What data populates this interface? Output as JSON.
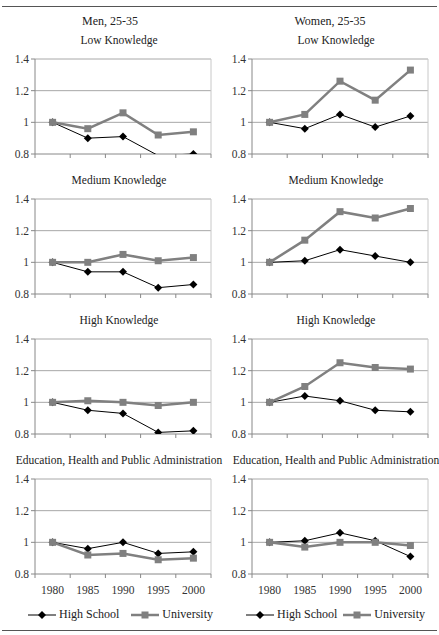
{
  "header": {
    "top_text": ""
  },
  "columns": [
    {
      "title": "Men, 25-35"
    },
    {
      "title": "Women, 25-35"
    }
  ],
  "legend": {
    "high_school": "High School",
    "university": "University"
  },
  "colors": {
    "high_school": "#000000",
    "university": "#808080",
    "grid": "#a8a8a8",
    "axis": "#888888"
  },
  "chart_data": [
    {
      "type": "line",
      "title": "Low Knowledge",
      "group": "Men, 25-35",
      "x": [
        1980,
        1985,
        1990,
        1995,
        2000
      ],
      "series": [
        {
          "name": "High School",
          "values": [
            1.0,
            0.9,
            0.91,
            0.79,
            0.8
          ]
        },
        {
          "name": "University",
          "values": [
            1.0,
            0.96,
            1.06,
            0.92,
            0.94
          ]
        }
      ],
      "ylim": [
        0.8,
        1.4
      ],
      "yticks": [
        0.8,
        1,
        1.2,
        1.4
      ],
      "grid": true
    },
    {
      "type": "line",
      "title": "Low Knowledge",
      "group": "Women, 25-35",
      "x": [
        1980,
        1985,
        1990,
        1995,
        2000
      ],
      "series": [
        {
          "name": "High School",
          "values": [
            1.0,
            0.96,
            1.05,
            0.97,
            1.04
          ]
        },
        {
          "name": "University",
          "values": [
            1.0,
            1.05,
            1.26,
            1.14,
            1.33
          ]
        }
      ],
      "ylim": [
        0.8,
        1.4
      ],
      "yticks": [
        0.8,
        1,
        1.2,
        1.4
      ],
      "grid": true
    },
    {
      "type": "line",
      "title": "Medium Knowledge",
      "group": "Men, 25-35",
      "x": [
        1980,
        1985,
        1990,
        1995,
        2000
      ],
      "series": [
        {
          "name": "High School",
          "values": [
            1.0,
            0.94,
            0.94,
            0.84,
            0.86
          ]
        },
        {
          "name": "University",
          "values": [
            1.0,
            1.0,
            1.05,
            1.01,
            1.03
          ]
        }
      ],
      "ylim": [
        0.8,
        1.4
      ],
      "yticks": [
        0.8,
        1,
        1.2,
        1.4
      ],
      "grid": true
    },
    {
      "type": "line",
      "title": "Medium Knowledge",
      "group": "Women, 25-35",
      "x": [
        1980,
        1985,
        1990,
        1995,
        2000
      ],
      "series": [
        {
          "name": "High School",
          "values": [
            1.0,
            1.01,
            1.08,
            1.04,
            1.0
          ]
        },
        {
          "name": "University",
          "values": [
            1.0,
            1.14,
            1.32,
            1.28,
            1.34
          ]
        }
      ],
      "ylim": [
        0.8,
        1.4
      ],
      "yticks": [
        0.8,
        1,
        1.2,
        1.4
      ],
      "grid": true
    },
    {
      "type": "line",
      "title": "High Knowledge",
      "group": "Men, 25-35",
      "x": [
        1980,
        1985,
        1990,
        1995,
        2000
      ],
      "series": [
        {
          "name": "High School",
          "values": [
            1.0,
            0.95,
            0.93,
            0.81,
            0.82
          ]
        },
        {
          "name": "University",
          "values": [
            1.0,
            1.01,
            1.0,
            0.98,
            1.0
          ]
        }
      ],
      "ylim": [
        0.8,
        1.4
      ],
      "yticks": [
        0.8,
        1,
        1.2,
        1.4
      ],
      "grid": true
    },
    {
      "type": "line",
      "title": "High Knowledge",
      "group": "Women, 25-35",
      "x": [
        1980,
        1985,
        1990,
        1995,
        2000
      ],
      "series": [
        {
          "name": "High School",
          "values": [
            1.0,
            1.04,
            1.01,
            0.95,
            0.94
          ]
        },
        {
          "name": "University",
          "values": [
            1.0,
            1.1,
            1.25,
            1.22,
            1.21
          ]
        }
      ],
      "ylim": [
        0.8,
        1.4
      ],
      "yticks": [
        0.8,
        1,
        1.2,
        1.4
      ],
      "grid": true
    },
    {
      "type": "line",
      "title": "Education, Health and Public Administration",
      "group": "Men, 25-35",
      "x": [
        1980,
        1985,
        1990,
        1995,
        2000
      ],
      "series": [
        {
          "name": "High School",
          "values": [
            1.0,
            0.96,
            1.0,
            0.93,
            0.94
          ]
        },
        {
          "name": "University",
          "values": [
            1.0,
            0.92,
            0.93,
            0.89,
            0.9
          ]
        }
      ],
      "ylim": [
        0.8,
        1.4
      ],
      "yticks": [
        0.8,
        1,
        1.2,
        1.4
      ],
      "grid": true
    },
    {
      "type": "line",
      "title": "Education, Health and Public Administration",
      "group": "Women, 25-35",
      "x": [
        1980,
        1985,
        1990,
        1995,
        2000
      ],
      "series": [
        {
          "name": "High School",
          "values": [
            1.0,
            1.01,
            1.06,
            1.01,
            0.91
          ]
        },
        {
          "name": "University",
          "values": [
            1.0,
            0.97,
            1.0,
            1.0,
            0.98
          ]
        }
      ],
      "ylim": [
        0.8,
        1.4
      ],
      "yticks": [
        0.8,
        1,
        1.2,
        1.4
      ],
      "grid": true
    }
  ]
}
